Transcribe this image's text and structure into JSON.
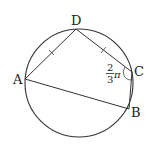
{
  "diagram": {
    "type": "inscribed-quadrilateral",
    "circle": {
      "cx": 79,
      "cy": 83,
      "r": 54
    },
    "points": {
      "A": {
        "label": "A",
        "x": 25,
        "y": 79
      },
      "B": {
        "label": "B",
        "x": 129,
        "y": 109
      },
      "C": {
        "label": "C",
        "x": 132,
        "y": 72
      },
      "D": {
        "label": "D",
        "x": 76,
        "y": 29
      }
    },
    "segments": [
      "AD",
      "DC",
      "CB",
      "BA"
    ],
    "equal_marks": [
      "AD",
      "DC"
    ],
    "angle_label": {
      "vertex": "C",
      "numerator": "2",
      "denominator": "3",
      "symbol": "π"
    },
    "stroke_color": "#333333"
  }
}
